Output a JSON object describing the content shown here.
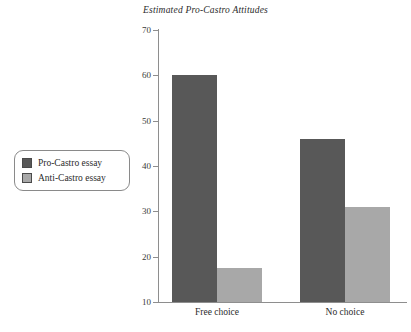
{
  "chart_data": {
    "type": "bar",
    "title": "Estimated Pro-Castro Attitudes",
    "xlabel": "",
    "ylabel": "",
    "ylim": [
      10,
      70
    ],
    "yticks": [
      10,
      20,
      30,
      40,
      50,
      60,
      70
    ],
    "ytick_labels": [
      "10",
      "20",
      "30",
      "40",
      "50",
      "60",
      "70"
    ],
    "grid": false,
    "legend_position": "left-outside",
    "categories": [
      "Free choice",
      "No choice"
    ],
    "series": [
      {
        "name": "Pro-Castro essay",
        "color": "#585858",
        "values": [
          60,
          46
        ]
      },
      {
        "name": "Anti-Castro essay",
        "color": "#a8a8a8",
        "values": [
          17.5,
          31
        ]
      }
    ]
  },
  "colors": {
    "background": "#ffffff",
    "axis": "#8e8e8e",
    "text": "#2b2b2b",
    "series_dark": "#585858",
    "series_light": "#a8a8a8",
    "legend_border": "#8a8a8a"
  }
}
